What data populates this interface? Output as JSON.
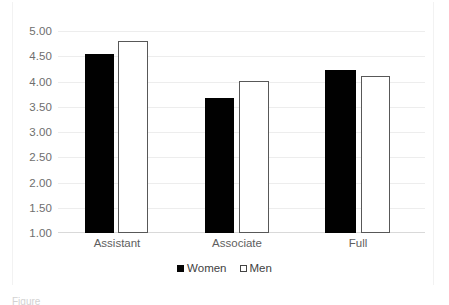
{
  "chart_data": {
    "type": "bar",
    "title": "",
    "subtitle": "",
    "xlabel": "",
    "ylabel": "",
    "categories": [
      "Assistant",
      "Associate",
      "Full"
    ],
    "series": [
      {
        "name": "Women",
        "values": [
          4.55,
          3.67,
          4.22
        ],
        "color": "#010101",
        "fill": "solid"
      },
      {
        "name": "Men",
        "values": [
          4.8,
          4.02,
          4.1
        ],
        "color": "#ffffff",
        "fill": "outline",
        "border": "#585858"
      }
    ],
    "ylim": [
      1.0,
      5.0
    ],
    "yticks": [
      "1.00",
      "1.50",
      "2.00",
      "2.50",
      "3.00",
      "3.50",
      "4.00",
      "4.50",
      "5.00"
    ],
    "ytick_values": [
      1.0,
      1.5,
      2.0,
      2.5,
      3.0,
      3.5,
      4.0,
      4.5,
      5.0
    ],
    "grid": true,
    "grid_axis": "y",
    "legend_position": "bottom"
  },
  "legend": {
    "items": [
      {
        "label": "Women",
        "swatch": "filled-square-icon"
      },
      {
        "label": "Men",
        "swatch": "outline-square-icon"
      }
    ]
  },
  "caption": {
    "text": "Figure"
  }
}
